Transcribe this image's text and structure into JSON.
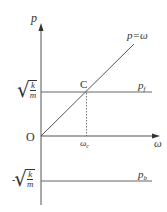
{
  "diagram": {
    "axes": {
      "y_label": "p",
      "x_label": "ω",
      "origin_label": "O"
    },
    "lines": {
      "diagonal_label": "p=ω",
      "upper_horizontal_label_main": "p",
      "upper_horizontal_label_sub": "f",
      "lower_horizontal_label_main": "p",
      "lower_horizontal_label_sub": "b"
    },
    "points": {
      "intersection_label": "C"
    },
    "ticks": {
      "x_tick_main": "ω",
      "x_tick_sub": "c",
      "y_upper_numerator": "k",
      "y_upper_denominator": "m",
      "y_lower_sign": "-",
      "y_lower_numerator": "k",
      "y_lower_denominator": "m"
    },
    "colors": {
      "line": "#555555",
      "text": "#333333",
      "background": "#ffffff"
    }
  }
}
